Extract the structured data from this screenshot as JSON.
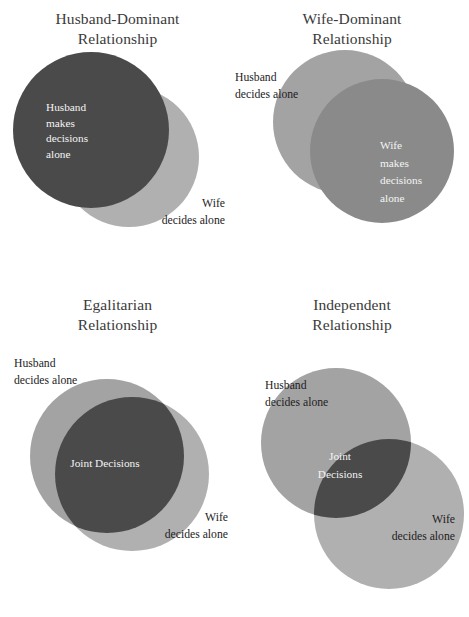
{
  "figure": {
    "title": "",
    "background_color": "#ffffff"
  },
  "palette": {
    "dark_gray": "#4a4a4a",
    "medium_gray": "#8a8a8a",
    "light_gray": "#b0b0b0",
    "title_color": "#3a3a3a",
    "outside_label_color": "#1d1d1d",
    "inside_label_color": "#f4f4f4"
  },
  "panels": [
    {
      "id": "husband-dominant",
      "title": "Husband-Dominant\nRelationship",
      "husband_label": "Husband\nmakes\ndecisions\nalone",
      "wife_label": "Wife\ndecides  alone",
      "joint_label": null,
      "husband_circle": {
        "cx": 83,
        "cy": 78,
        "r": 78,
        "fill": "#4a4a4a"
      },
      "wife_circle": {
        "cx": 121,
        "cy": 105,
        "r": 70,
        "fill": "#b0b0b0"
      },
      "draw_order": [
        "wife",
        "husband"
      ]
    },
    {
      "id": "wife-dominant",
      "title": "Wife-Dominant\nRelationship",
      "husband_label": "Husband\ndecides alone",
      "wife_label": "Wife\nmakes\ndecisions\nalone",
      "joint_label": null,
      "husband_circle": {
        "cx": 96,
        "cy": 72,
        "r": 72,
        "fill": "#a3a3a3"
      },
      "wife_circle": {
        "cx": 133,
        "cy": 101,
        "r": 72,
        "fill": "#8a8a8a"
      },
      "draw_order": [
        "husband",
        "wife"
      ]
    },
    {
      "id": "egalitarian",
      "title": "Egalitarian\nRelationship",
      "husband_label": "Husband\ndecides alone",
      "wife_label": "Wife\ndecides  alone",
      "joint_label": "Joint Decisions",
      "husband_circle": {
        "cx": 85,
        "cy": 88,
        "r": 77,
        "fill": "#a3a3a3"
      },
      "wife_circle": {
        "cx": 110,
        "cy": 106,
        "r": 77,
        "fill": "#b0b0b0"
      },
      "joint_lens_fill": "#4a4a4a",
      "draw_order": [
        "husband",
        "wife",
        "joint"
      ]
    },
    {
      "id": "independent",
      "title": "Independent\nRelationship",
      "husband_label": "Husband\ndecides alone",
      "wife_label": "Wife\ndecides  alone",
      "joint_label": "Joint\nDecisions",
      "husband_circle": {
        "cx": 81,
        "cy": 81,
        "r": 75,
        "fill": "#a3a3a3"
      },
      "wife_circle": {
        "cx": 134,
        "cy": 152,
        "r": 75,
        "fill": "#b0b0b0"
      },
      "joint_lens_fill": "#4a4a4a",
      "draw_order": [
        "husband",
        "wife",
        "joint"
      ]
    }
  ],
  "diagram_data": {
    "type": "venn",
    "description": "Four two-set Venn diagrams comparing marital decision-making patterns",
    "sets": [
      "Husband decides alone",
      "Wife decides alone"
    ],
    "panel_count": 4,
    "overlap_label": "Joint Decisions"
  }
}
